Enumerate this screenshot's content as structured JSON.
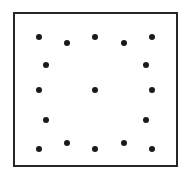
{
  "figure": {
    "canvas": {
      "width": 191,
      "height": 179,
      "background": "#ffffff"
    },
    "frame": {
      "name": "square-border",
      "x": 13,
      "y": 12,
      "width": 165,
      "height": 155,
      "border_width": 2,
      "border_color": "#262626",
      "fill": "#ffffff"
    },
    "dot_style": {
      "diameter": 6,
      "color": "#1a1a1a",
      "shape": "circle"
    },
    "dot_count": 17,
    "dots": [
      {
        "id": "r1c1",
        "x": 39,
        "y": 37,
        "row": 1,
        "col": 1
      },
      {
        "id": "r1c2",
        "x": 67,
        "y": 43,
        "row": 1,
        "col": 2
      },
      {
        "id": "r1c3",
        "x": 95,
        "y": 37,
        "row": 1,
        "col": 3
      },
      {
        "id": "r1c4",
        "x": 124,
        "y": 43,
        "row": 1,
        "col": 4
      },
      {
        "id": "r1c5",
        "x": 152,
        "y": 37,
        "row": 1,
        "col": 5
      },
      {
        "id": "r2c1",
        "x": 46,
        "y": 65,
        "row": 2,
        "col": 1
      },
      {
        "id": "r2c2",
        "x": 146,
        "y": 65,
        "row": 2,
        "col": 2
      },
      {
        "id": "r3c1",
        "x": 39,
        "y": 90,
        "row": 3,
        "col": 1
      },
      {
        "id": "r3c2",
        "x": 95,
        "y": 90,
        "row": 3,
        "col": 2
      },
      {
        "id": "r3c3",
        "x": 152,
        "y": 90,
        "row": 3,
        "col": 3
      },
      {
        "id": "r4c1",
        "x": 46,
        "y": 120,
        "row": 4,
        "col": 1
      },
      {
        "id": "r4c2",
        "x": 146,
        "y": 120,
        "row": 4,
        "col": 2
      },
      {
        "id": "r5c1",
        "x": 39,
        "y": 149,
        "row": 5,
        "col": 1
      },
      {
        "id": "r5c2",
        "x": 67,
        "y": 143,
        "row": 5,
        "col": 2
      },
      {
        "id": "r5c3",
        "x": 95,
        "y": 149,
        "row": 5,
        "col": 3
      },
      {
        "id": "r5c4",
        "x": 124,
        "y": 143,
        "row": 5,
        "col": 4
      },
      {
        "id": "r5c5",
        "x": 152,
        "y": 149,
        "row": 5,
        "col": 5
      }
    ]
  }
}
